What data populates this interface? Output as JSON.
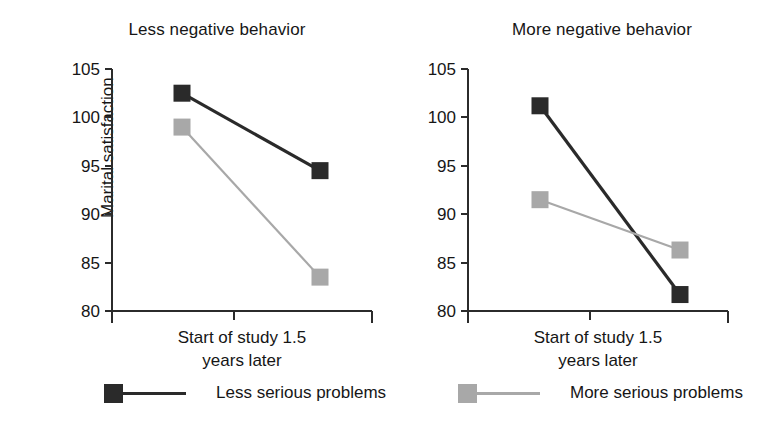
{
  "figure": {
    "ylabel": "Marital satisfaction",
    "series_colors": {
      "less_serious": "#2a2a2a",
      "more_serious": "#a8a8a8"
    }
  },
  "legend": {
    "items": [
      {
        "label": "Less serious problems",
        "marker": "filled-square-dark",
        "color": "#2a2a2a"
      },
      {
        "label": "More serious problems",
        "marker": "filled-square-gray",
        "color": "#a8a8a8"
      }
    ]
  },
  "chart_data": [
    {
      "type": "line",
      "title": "Less negative behavior",
      "xlabel": "",
      "ylabel": "Marital satisfaction",
      "categories": [
        "Start of study",
        "1.5 years later"
      ],
      "xtick_labels_rendered": [
        "Start of study 1.5",
        "years later"
      ],
      "ylim": [
        80,
        105
      ],
      "yticks": [
        80,
        85,
        90,
        95,
        100,
        105
      ],
      "grid": false,
      "legend_position": "below",
      "series": [
        {
          "name": "Less serious problems",
          "color": "#2a2a2a",
          "values": [
            102.5,
            94.5
          ]
        },
        {
          "name": "More serious problems",
          "color": "#a8a8a8",
          "values": [
            99.0,
            83.5
          ]
        }
      ]
    },
    {
      "type": "line",
      "title": "More negative behavior",
      "xlabel": "",
      "ylabel": "",
      "categories": [
        "Start of study",
        "1.5 years later"
      ],
      "xtick_labels_rendered": [
        "Start of study 1.5",
        "years later"
      ],
      "ylim": [
        80,
        105
      ],
      "yticks": [
        80,
        85,
        90,
        95,
        100,
        105
      ],
      "grid": false,
      "legend_position": "below",
      "series": [
        {
          "name": "Less serious problems",
          "color": "#2a2a2a",
          "values": [
            101.2,
            81.7
          ]
        },
        {
          "name": "More serious problems",
          "color": "#a8a8a8",
          "values": [
            91.5,
            86.3
          ]
        }
      ]
    }
  ]
}
